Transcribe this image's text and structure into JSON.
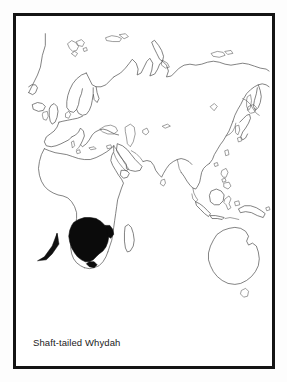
{
  "figure": {
    "kind": "species-distribution-map",
    "caption": "Shaft-tailed Whydah",
    "frame": {
      "border_color": "#141414",
      "border_width_px": 3,
      "background_color": "#ffffff"
    },
    "page_background": "#fdfdfd"
  },
  "map": {
    "projection_extent": "Old World: Europe, Africa, Asia, Australasia",
    "coastline_color": "#4a4a4a",
    "range_fill_color": "#0b0b0b",
    "ocean_color": "#ffffff",
    "landmasses": [
      "Europe",
      "Africa",
      "Asia",
      "Arabian Peninsula",
      "India",
      "Sri Lanka",
      "Japan",
      "Korea",
      "Kamchatka",
      "Philippines",
      "Indonesia",
      "Borneo",
      "Sulawesi",
      "New Guinea",
      "Australia",
      "Tasmania",
      "Madagascar",
      "Iceland",
      "British Isles",
      "Svalbard",
      "Novaya Zemlya",
      "Greenland edge"
    ],
    "range": {
      "label": "breeding-range",
      "region": "southern Africa",
      "countries": [
        "Botswana",
        "Namibia",
        "Zimbabwe",
        "South Africa"
      ],
      "fill": "#0b0b0b"
    },
    "annotation_arrow": {
      "name": "range-pointer-arrow",
      "direction": "up-right",
      "points_to": "southern Africa range",
      "color": "#111111"
    }
  }
}
